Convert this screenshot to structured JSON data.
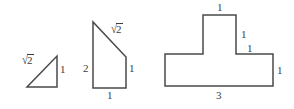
{
  "figure": {
    "background_color": "#ffffff",
    "stroke_color": "#4a4a4a",
    "text_color": "#3d3d3d",
    "stroke_width": 1.5,
    "width": 294,
    "height": 109
  },
  "shapes": [
    {
      "name": "right-triangle",
      "kind": "triangle",
      "labels": [
        {
          "id": "s1-hypotenuse",
          "text": "√2",
          "radical": true,
          "radicand": "2"
        },
        {
          "id": "s1-vertical",
          "text": "1"
        }
      ]
    },
    {
      "name": "right-trapezoid",
      "kind": "trapezoid",
      "labels": [
        {
          "id": "s2-slant",
          "text": "√2",
          "radical": true,
          "radicand": "2"
        },
        {
          "id": "s2-left",
          "text": "2"
        },
        {
          "id": "s2-right",
          "text": "1"
        },
        {
          "id": "s2-bottom",
          "text": "1"
        }
      ]
    },
    {
      "name": "t-shaped-polygon",
      "kind": "t-shape",
      "labels": [
        {
          "id": "s3-top",
          "text": "1"
        },
        {
          "id": "s3-stem-right",
          "text": "1"
        },
        {
          "id": "s3-shoulder",
          "text": "1"
        },
        {
          "id": "s3-right",
          "text": "1"
        },
        {
          "id": "s3-bottom",
          "text": "3"
        }
      ]
    }
  ],
  "labels": {
    "shape1": {
      "hypotenuse_radicand": "2",
      "vertical": "1"
    },
    "shape2": {
      "slant_radicand": "2",
      "left": "2",
      "right": "1",
      "bottom": "1"
    },
    "shape3": {
      "top": "1",
      "stem_right": "1",
      "shoulder": "1",
      "right": "1",
      "bottom": "3"
    }
  }
}
